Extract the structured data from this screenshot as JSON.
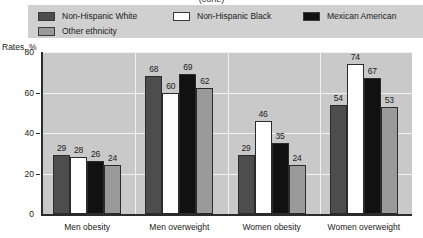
{
  "title_remnant": "(cont.)",
  "legend": {
    "items": [
      {
        "label": "Non-Hispanic White",
        "color": "#4d4d4d",
        "name": "legend-non-hispanic-white"
      },
      {
        "label": "Non-Hispanic Black",
        "color": "#ffffff",
        "name": "legend-non-hispanic-black"
      },
      {
        "label": "Mexican American",
        "color": "#111111",
        "name": "legend-mexican-american"
      },
      {
        "label": "Other ethnicity",
        "color": "#9a9a9a",
        "name": "legend-other-ethnicity"
      }
    ]
  },
  "axis": {
    "y_title": "Rates, %",
    "y_ticks": [
      "80",
      "60",
      "40",
      "20",
      "0"
    ]
  },
  "chart_data": {
    "type": "bar",
    "title": "",
    "xlabel": "",
    "ylabel": "Rates, %",
    "ylim": [
      0,
      80
    ],
    "yticks": [
      0,
      20,
      40,
      60,
      80
    ],
    "grid": true,
    "legend_position": "top",
    "categories": [
      "Men obesity",
      "Men overweight",
      "Women obesity",
      "Women overweight"
    ],
    "series": [
      {
        "name": "Non-Hispanic White",
        "color": "#4d4d4d",
        "values": [
          29,
          68,
          29,
          54
        ]
      },
      {
        "name": "Non-Hispanic Black",
        "color": "#ffffff",
        "values": [
          28,
          60,
          46,
          74
        ]
      },
      {
        "name": "Mexican American",
        "color": "#111111",
        "values": [
          26,
          69,
          35,
          67
        ]
      },
      {
        "name": "Other ethnicity",
        "color": "#9a9a9a",
        "values": [
          24,
          62,
          24,
          53
        ]
      }
    ]
  }
}
